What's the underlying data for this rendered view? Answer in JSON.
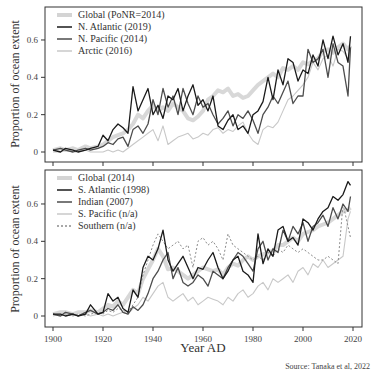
{
  "chart_data": [
    {
      "type": "line",
      "panel": "top",
      "title": "",
      "xlabel": "",
      "ylabel": "Proportion of ocean extent",
      "xlim": [
        1897,
        2021
      ],
      "ylim": [
        -0.04,
        0.78
      ],
      "yticks": [
        0,
        0.2,
        0.4,
        0.6
      ],
      "ytick_labels": [
        "0",
        "0.2",
        "0.4",
        "0.6"
      ],
      "xticks": [
        1900,
        1920,
        1940,
        1960,
        1980,
        2000,
        2020
      ],
      "grid": false,
      "legend_position": "upper left",
      "x": [
        1900,
        1903,
        1905,
        1908,
        1910,
        1913,
        1915,
        1918,
        1920,
        1922,
        1924,
        1926,
        1928,
        1930,
        1932,
        1934,
        1936,
        1938,
        1940,
        1942,
        1944,
        1946,
        1948,
        1950,
        1952,
        1954,
        1956,
        1958,
        1960,
        1962,
        1964,
        1966,
        1968,
        1970,
        1972,
        1974,
        1976,
        1978,
        1980,
        1982,
        1984,
        1986,
        1988,
        1990,
        1992,
        1994,
        1996,
        1998,
        2000,
        2002,
        2004,
        2006,
        2008,
        2010,
        2012,
        2014,
        2016,
        2018,
        2019
      ],
      "series": [
        {
          "name": "Global (PoNR=2014)",
          "style": "thick-light-gray",
          "values": [
            0.01,
            0.02,
            0.01,
            0.02,
            0.01,
            0.03,
            0.02,
            0.03,
            0.04,
            0.06,
            0.08,
            0.09,
            0.1,
            0.12,
            0.15,
            0.2,
            0.18,
            0.22,
            0.25,
            0.22,
            0.24,
            0.22,
            0.26,
            0.24,
            0.22,
            0.18,
            0.17,
            0.19,
            0.22,
            0.28,
            0.3,
            0.33,
            0.32,
            0.34,
            0.3,
            0.31,
            0.29,
            0.3,
            0.33,
            0.36,
            0.38,
            0.4,
            0.42,
            0.4,
            0.45,
            0.44,
            0.46,
            0.44,
            0.48,
            0.47,
            0.49,
            0.5,
            0.54,
            0.55,
            0.53,
            0.56,
            0.58,
            0.55,
            0.57
          ]
        },
        {
          "name": "N. Atlantic (2019)",
          "style": "black",
          "values": [
            0.01,
            0.0,
            0.02,
            0.01,
            0.0,
            0.01,
            0.02,
            0.03,
            0.09,
            0.06,
            0.12,
            0.15,
            0.13,
            0.1,
            0.35,
            0.22,
            0.28,
            0.34,
            0.2,
            0.25,
            0.18,
            0.3,
            0.28,
            0.34,
            0.22,
            0.3,
            0.36,
            0.25,
            0.28,
            0.22,
            0.3,
            0.14,
            0.12,
            0.17,
            0.2,
            0.12,
            0.14,
            0.1,
            0.2,
            0.22,
            0.27,
            0.4,
            0.28,
            0.44,
            0.36,
            0.5,
            0.48,
            0.38,
            0.44,
            0.42,
            0.52,
            0.46,
            0.6,
            0.5,
            0.62,
            0.52,
            0.58,
            0.48,
            0.62
          ]
        },
        {
          "name": "N. Pacific (2014)",
          "style": "dark-gray",
          "values": [
            0.01,
            0.02,
            0.01,
            0.0,
            0.01,
            0.02,
            0.01,
            0.02,
            0.03,
            0.05,
            0.04,
            0.07,
            0.08,
            0.03,
            0.12,
            0.14,
            0.1,
            0.15,
            0.28,
            0.2,
            0.34,
            0.24,
            0.3,
            0.2,
            0.34,
            0.26,
            0.2,
            0.3,
            0.24,
            0.26,
            0.2,
            0.15,
            0.18,
            0.22,
            0.14,
            0.2,
            0.18,
            0.22,
            0.17,
            0.1,
            0.2,
            0.24,
            0.3,
            0.26,
            0.32,
            0.38,
            0.26,
            0.3,
            0.3,
            0.55,
            0.48,
            0.5,
            0.55,
            0.4,
            0.58,
            0.48,
            0.46,
            0.3,
            0.56
          ]
        },
        {
          "name": "Arctic (2016)",
          "style": "light-gray",
          "values": [
            0.0,
            0.0,
            0.01,
            0.0,
            0.0,
            0.01,
            0.0,
            0.0,
            0.0,
            0.01,
            0.0,
            0.01,
            0.0,
            0.02,
            0.04,
            0.06,
            0.08,
            0.1,
            0.12,
            0.06,
            0.14,
            0.04,
            0.06,
            0.08,
            0.09,
            0.1,
            0.07,
            0.08,
            0.1,
            0.09,
            0.12,
            0.13,
            0.1,
            0.12,
            0.11,
            0.14,
            0.16,
            0.1,
            0.06,
            0.04,
            0.12,
            0.14,
            0.13,
            0.16,
            0.22,
            0.28,
            0.3,
            0.33,
            0.36,
            0.4,
            0.48,
            0.44,
            0.5,
            0.52,
            0.46,
            0.55,
            0.54,
            0.5,
            0.56
          ]
        }
      ]
    },
    {
      "type": "line",
      "panel": "bottom",
      "title": "",
      "xlabel": "Year AD",
      "ylabel": "Proportion of ocean extent",
      "xlim": [
        1897,
        2021
      ],
      "ylim": [
        -0.04,
        0.78
      ],
      "yticks": [
        0,
        0.2,
        0.4,
        0.6
      ],
      "ytick_labels": [
        "0",
        "0.2",
        "0.4",
        "0.6"
      ],
      "xticks": [
        1900,
        1920,
        1940,
        1960,
        1980,
        2000,
        2020
      ],
      "xtick_labels": [
        "1900",
        "1920",
        "1940",
        "1960",
        "1980",
        "2000",
        "2020"
      ],
      "grid": false,
      "legend_position": "upper left",
      "x": [
        1900,
        1903,
        1905,
        1908,
        1910,
        1913,
        1915,
        1918,
        1920,
        1922,
        1924,
        1926,
        1928,
        1930,
        1932,
        1934,
        1936,
        1938,
        1940,
        1942,
        1944,
        1946,
        1948,
        1950,
        1952,
        1954,
        1956,
        1958,
        1960,
        1962,
        1964,
        1966,
        1968,
        1970,
        1972,
        1974,
        1976,
        1978,
        1980,
        1982,
        1984,
        1986,
        1988,
        1990,
        1992,
        1994,
        1996,
        1998,
        2000,
        2002,
        2004,
        2006,
        2008,
        2010,
        2012,
        2014,
        2016,
        2018,
        2019
      ],
      "series": [
        {
          "name": "Global (2014)",
          "style": "thick-light-gray",
          "values": [
            0.01,
            0.02,
            0.02,
            0.01,
            0.02,
            0.02,
            0.03,
            0.02,
            0.04,
            0.06,
            0.05,
            0.08,
            0.06,
            0.1,
            0.14,
            0.12,
            0.2,
            0.25,
            0.3,
            0.36,
            0.32,
            0.25,
            0.26,
            0.24,
            0.22,
            0.2,
            0.22,
            0.24,
            0.26,
            0.25,
            0.24,
            0.25,
            0.22,
            0.26,
            0.28,
            0.27,
            0.3,
            0.32,
            0.3,
            0.32,
            0.33,
            0.34,
            0.35,
            0.38,
            0.38,
            0.4,
            0.42,
            0.4,
            0.44,
            0.45,
            0.46,
            0.48,
            0.49,
            0.5,
            0.52,
            0.54,
            0.56,
            0.57,
            0.58
          ]
        },
        {
          "name": "S. Atlantic (1998)",
          "style": "black",
          "values": [
            0.01,
            0.01,
            0.0,
            0.01,
            0.0,
            0.01,
            0.06,
            0.01,
            0.02,
            0.12,
            0.08,
            0.1,
            0.04,
            0.02,
            0.14,
            0.1,
            0.26,
            0.32,
            0.3,
            0.36,
            0.46,
            0.3,
            0.24,
            0.28,
            0.32,
            0.26,
            0.2,
            0.26,
            0.25,
            0.3,
            0.34,
            0.26,
            0.2,
            0.24,
            0.3,
            0.32,
            0.24,
            0.22,
            0.18,
            0.44,
            0.28,
            0.36,
            0.32,
            0.46,
            0.48,
            0.4,
            0.42,
            0.38,
            0.52,
            0.5,
            0.46,
            0.52,
            0.56,
            0.58,
            0.64,
            0.62,
            0.65,
            0.72,
            0.7
          ]
        },
        {
          "name": "Indian (2007)",
          "style": "dark-gray",
          "values": [
            0.01,
            0.0,
            0.02,
            0.01,
            0.0,
            0.02,
            0.03,
            0.01,
            0.02,
            0.04,
            0.03,
            0.06,
            0.02,
            0.01,
            0.05,
            0.03,
            0.06,
            0.12,
            0.2,
            0.24,
            0.3,
            0.34,
            0.2,
            0.26,
            0.18,
            0.16,
            0.18,
            0.22,
            0.2,
            0.16,
            0.24,
            0.22,
            0.2,
            0.26,
            0.3,
            0.34,
            0.32,
            0.28,
            0.24,
            0.36,
            0.4,
            0.3,
            0.36,
            0.34,
            0.46,
            0.4,
            0.48,
            0.44,
            0.5,
            0.4,
            0.48,
            0.5,
            0.54,
            0.48,
            0.58,
            0.52,
            0.6,
            0.56,
            0.64
          ]
        },
        {
          "name": "S. Pacific (n/a)",
          "style": "light-gray",
          "values": [
            0.0,
            0.01,
            0.0,
            0.01,
            0.0,
            0.01,
            0.0,
            0.01,
            0.0,
            0.01,
            0.0,
            0.01,
            0.02,
            0.01,
            0.04,
            0.06,
            0.1,
            0.08,
            0.12,
            0.16,
            0.18,
            0.1,
            0.08,
            0.1,
            0.12,
            0.08,
            0.1,
            0.06,
            0.08,
            0.1,
            0.09,
            0.08,
            0.06,
            0.1,
            0.08,
            0.12,
            0.14,
            0.1,
            0.12,
            0.16,
            0.18,
            0.14,
            0.2,
            0.18,
            0.2,
            0.22,
            0.18,
            0.24,
            0.26,
            0.22,
            0.28,
            0.26,
            0.3,
            0.26,
            0.28,
            0.3,
            0.32,
            0.52,
            0.56
          ]
        },
        {
          "name": "Southern (n/a)",
          "style": "dotted-gray",
          "values": [
            0.01,
            0.0,
            0.01,
            0.0,
            0.01,
            0.0,
            0.01,
            0.02,
            0.01,
            0.03,
            0.02,
            0.04,
            0.03,
            0.02,
            0.06,
            0.1,
            0.22,
            0.3,
            0.38,
            0.44,
            0.4,
            0.36,
            0.38,
            0.4,
            0.36,
            0.38,
            0.26,
            0.4,
            0.42,
            0.38,
            0.4,
            0.36,
            0.3,
            0.44,
            0.38,
            0.36,
            0.34,
            0.32,
            0.3,
            0.32,
            0.3,
            0.34,
            0.32,
            0.36,
            0.34,
            0.38,
            0.36,
            0.34,
            0.36,
            0.34,
            0.32,
            0.3,
            0.3,
            0.32,
            0.3,
            0.28,
            0.6,
            0.48,
            0.42
          ]
        }
      ]
    }
  ],
  "source_text": "Source: Tanaka et al, 2022",
  "xaxis_title": "Year AD",
  "yaxis_title": "Proportion of ocean extent",
  "legend_top": [
    "Global (PoNR=2014)",
    "N. Atlantic (2019)",
    "N. Pacific (2014)",
    "Arctic (2016)"
  ],
  "legend_bottom": [
    "Global (2014)",
    "S. Atlantic (1998)",
    "Indian (2007)",
    "S. Pacific (n/a)",
    "Southern (n/a)"
  ],
  "colors": {
    "black": "#1a1a1a",
    "dark-gray": "#4d4d4d",
    "light-gray": "#c8c8c8",
    "thick-light-gray": "#d4d4d4",
    "dotted-gray": "#8c8c8c",
    "frame": "#333333"
  }
}
